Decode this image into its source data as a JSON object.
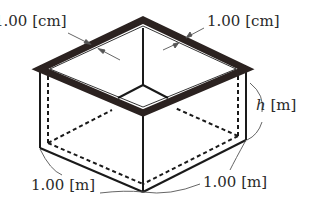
{
  "figure": {
    "labels": {
      "wall_thickness_left": "1.00 [cm]",
      "wall_thickness_right": "1.00 [cm]",
      "height_var": "h",
      "height_unit": " [m]",
      "base_side_left": "1.00 [m]",
      "base_side_right": "1.00 [m]"
    },
    "colors": {
      "rim": "#2b2220",
      "edges": "#1a1a1a",
      "annotation": "#555555"
    }
  }
}
